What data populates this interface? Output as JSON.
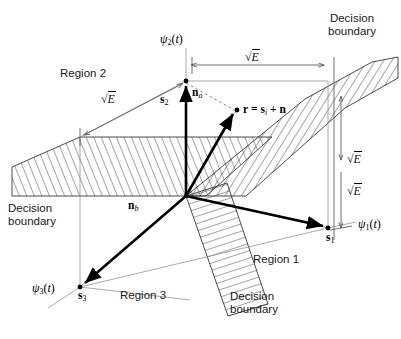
{
  "figure": {
    "background_color": "#ffffff",
    "line_color": "#000000",
    "thin_line_color": "#808080",
    "hatch_color": "#3a3a3a",
    "caption": ""
  },
  "axes": [
    {
      "id": "psi1",
      "label_main": "ψ",
      "label_sub": "1",
      "label_arg": "(t)",
      "text": "ψ1(t)"
    },
    {
      "id": "psi2",
      "label_main": "ψ",
      "label_sub": "2",
      "label_arg": "(t)",
      "text": "ψ2(t)"
    },
    {
      "id": "psi3",
      "label_main": "ψ",
      "label_sub": "3",
      "label_arg": "(t)",
      "text": "ψ3(t)"
    }
  ],
  "signal_points": [
    {
      "id": "s1",
      "symbol": "s",
      "sub": "1",
      "text": "s1"
    },
    {
      "id": "s2",
      "symbol": "s",
      "sub": "2",
      "text": "s2"
    },
    {
      "id": "s3",
      "symbol": "s",
      "sub": "3",
      "text": "s3"
    }
  ],
  "noise_vectors": [
    {
      "id": "na",
      "symbol": "n",
      "sub": "a",
      "text": "na"
    },
    {
      "id": "nb",
      "symbol": "n",
      "sub": "b",
      "text": "nb"
    }
  ],
  "received_vector": {
    "id": "r",
    "lhs": "r",
    "equals": " = ",
    "rhs_sym": "s",
    "rhs_sub": "i",
    "plus": " + ",
    "noise": "n",
    "text": "r = si + n"
  },
  "energy_labels": [
    {
      "id": "sqrtE-region2",
      "prefix": "√",
      "radicand": "E",
      "text": "√E"
    },
    {
      "id": "sqrtE-top",
      "prefix": "√",
      "radicand": "E",
      "text": "√E"
    },
    {
      "id": "sqrtE-right",
      "prefix": "√",
      "radicand": "E",
      "text": "√E"
    },
    {
      "id": "sqrtE-bottom-right",
      "prefix": "√",
      "radicand": "E",
      "text": "√E"
    }
  ],
  "regions": [
    {
      "id": "region1",
      "text": "Region 1"
    },
    {
      "id": "region2",
      "text": "Region 2"
    },
    {
      "id": "region3",
      "text": "Region 3"
    }
  ],
  "decision_boundaries": [
    {
      "id": "db-top-right",
      "line1": "Decision",
      "line2": "boundary"
    },
    {
      "id": "db-left",
      "line1": "Decision",
      "line2": "boundary"
    },
    {
      "id": "db-bottom",
      "line1": "Decision",
      "line2": "boundary"
    }
  ]
}
